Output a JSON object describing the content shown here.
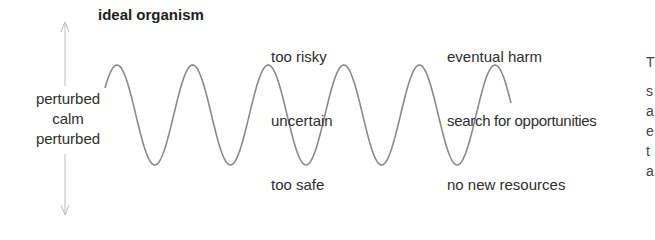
{
  "title": "ideal organism",
  "axis": {
    "labels": [
      "perturbed",
      "calm",
      "perturbed"
    ],
    "arrow_color": "#bdbdbd"
  },
  "wave": {
    "color": "#8a8a8a",
    "start_x": 105,
    "end_x": 511,
    "mid_y": 115,
    "amplitude": 50,
    "period": 75.6,
    "first_peak_x": 117
  },
  "annotations": {
    "column1": {
      "top": "too risky",
      "middle": "uncertain",
      "bottom": "too safe"
    },
    "column2": {
      "top": "eventual harm",
      "middle": "search for opportunities",
      "bottom": "no new resources"
    }
  },
  "cutoff_text": [
    "T",
    "s",
    "a",
    "e",
    "t",
    "a"
  ]
}
